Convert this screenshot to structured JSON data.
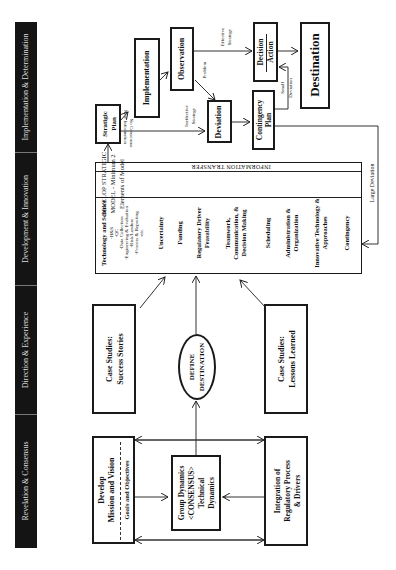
{
  "phases": [
    {
      "label": "Implementation & Determination"
    },
    {
      "label": "Development & Innovation"
    },
    {
      "label": "Direction & Experience"
    },
    {
      "label": "Revelation & Consensus"
    }
  ],
  "nodes": {
    "mission": {
      "line1": "Develop",
      "line2": "Mission and Vision",
      "sub": "Goals and Objectives"
    },
    "group_dynamics": {
      "line1": "Group Dynamics",
      "line2": "<CONSENSUS>",
      "line3": "Technical",
      "line4": "Dynamics"
    },
    "regulatory": {
      "line1": "Integration of",
      "line2": "Regulatory Process",
      "line3": "& Drivers"
    },
    "success": {
      "line1": "Case Studies:",
      "line2": "Success Stories"
    },
    "define": {
      "line1": "DEFINE",
      "line2": "DESTINATION"
    },
    "lessons": {
      "line1": "Case Studies:",
      "line2": "Lessons Learned"
    },
    "model": {
      "title1": "DEVELOP STRATIGIC",
      "title2": "MODEL - Minimum 2",
      "title3": "Elements of Model",
      "info_transfer": "INFORMATION TRANSFER",
      "tech_heading": "Technology and Science",
      "tech_subitems": [
        "-H&S",
        "-QC",
        "-Data Collection",
        "-Engineering & Evaluation",
        "-Risk/Landuse",
        "-Process & Reporting",
        "-etc."
      ],
      "items": [
        [
          "Uncertainty"
        ],
        [
          "Funding"
        ],
        [
          "Regulatory Driver",
          "Feasability"
        ],
        [
          "Teamwork,",
          "Communication, &",
          "Decision Making"
        ],
        [
          "Scheduling"
        ],
        [
          "Administration &",
          "Organization"
        ],
        [
          "Innovative Technology &",
          "Approaches"
        ],
        [
          "Contingency"
        ]
      ]
    },
    "strategic_plan": {
      "line1": "Stratigic",
      "line2": "Plan"
    },
    "implementation": {
      "label": "Implementation"
    },
    "observation": {
      "label": "Observation"
    },
    "deviation": {
      "label": "Deviation"
    },
    "contingency_plan": {
      "line1": "Contingency",
      "line2": "Plan"
    },
    "decision": {
      "line1": "Decision",
      "line2": "Action"
    },
    "destination": {
      "label": "Destination"
    }
  },
  "edge_labels": {
    "no_consensus": "No Consensus",
    "new_information": "New Information",
    "ineffective": "Ineffective",
    "strategy1": "Strategy",
    "problem": "Problem",
    "effective": "Effective",
    "strategy2": "Strategy",
    "small": "Small",
    "deviation_small": "Deviation",
    "large_deviation": "Large Deviation"
  }
}
